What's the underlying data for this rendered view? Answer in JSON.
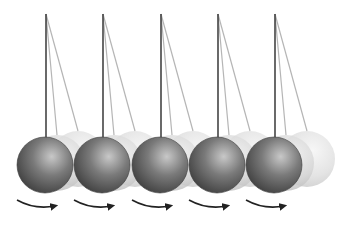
{
  "illustration": {
    "subject": "pendulum-balls-motion",
    "background": "#ffffff",
    "pivot_y": 14,
    "rest_center_y": 165,
    "ball_radius": 28,
    "pendulums": [
      {
        "pivot_x": 46
      },
      {
        "pivot_x": 103
      },
      {
        "pivot_x": 161
      },
      {
        "pivot_x": 218
      },
      {
        "pivot_x": 275
      }
    ],
    "ghost_offsets": [
      {
        "dx": 11,
        "dy": -2,
        "opacity": 0.45
      },
      {
        "dx": 32,
        "dy": -6,
        "opacity": 0.28
      }
    ],
    "colors": {
      "ball_highlight": "#c8c8c8",
      "ball_mid": "#7a7a7a",
      "ball_shadow": "#3a3a3a",
      "string": "#444444",
      "ghost_string": "#b5b5b5",
      "arrow": "#222222"
    },
    "arrow_direction": "clockwise-right"
  }
}
